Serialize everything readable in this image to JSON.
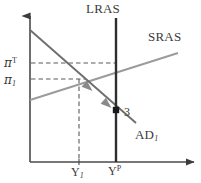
{
  "diagram": {
    "type": "economics-ad-as",
    "colors": {
      "axis": "#4a4a4a",
      "lras": "#2e2e2e",
      "sras": "#9b9b9b",
      "ad": "#6e6e6e",
      "dashed": "#5a5a5a",
      "text": "#3a3a3a",
      "marker": "#1a1a1a"
    },
    "labels": {
      "lras": "LRAS",
      "sras": "SRAS",
      "ad_main": "AD",
      "ad_sub": "1",
      "point_number": "3",
      "pi_target_symbol": "π",
      "pi_target_sup": "T",
      "pi_1_symbol": "π",
      "pi_1_sub": "1",
      "y1_main": "Y",
      "y1_sub": "1",
      "yp_main": "Y",
      "yp_sup": "P"
    },
    "geometry": {
      "axis_origin": {
        "x": 30,
        "y": 162
      },
      "y_axis_top": {
        "x": 30,
        "y": 14
      },
      "x_axis_right": {
        "x": 196,
        "y": 162
      },
      "lras_x": 116,
      "lras_top_y": 18,
      "lras_bottom_y": 162,
      "sras_start": {
        "x": 30,
        "y": 100
      },
      "sras_end": {
        "x": 178,
        "y": 53
      },
      "ad_start": {
        "x": 30,
        "y": 30
      },
      "ad_end": {
        "x": 136,
        "y": 123
      },
      "pi_target_y": 63,
      "pi_1_y": 79,
      "y1_x": 79,
      "yp_x": 116,
      "equilibrium_point": {
        "x": 79,
        "y": 79
      },
      "marker_point": {
        "x": 116,
        "y": 110
      },
      "arrow_1": {
        "x": 89,
        "y": 89
      },
      "arrow_2": {
        "x": 108,
        "y": 103
      }
    },
    "arrow_direction": "down-right along AD curve toward point 3"
  }
}
